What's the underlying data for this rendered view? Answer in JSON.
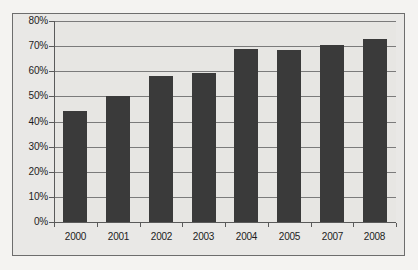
{
  "chart_data": {
    "type": "bar",
    "title": "",
    "subtitle": "",
    "xlabel": "",
    "ylabel": "",
    "categories": [
      "2000",
      "2001",
      "2002",
      "2003",
      "2004",
      "2005",
      "2007",
      "2008"
    ],
    "values": [
      44,
      50,
      58,
      59.5,
      69,
      68.5,
      70.5,
      73
    ],
    "ylim": [
      0,
      80
    ],
    "ytick_step": 10,
    "ytick_labels": [
      "0%",
      "10%",
      "20%",
      "30%",
      "40%",
      "50%",
      "60%",
      "70%",
      "80%"
    ],
    "ytick_values": [
      0,
      10,
      20,
      30,
      40,
      50,
      60,
      70,
      80
    ],
    "grid": true,
    "grid_axis": "y",
    "legend": false,
    "legend_position": "none",
    "series": [
      {
        "name": "Series 1",
        "color": "#3a3a3a",
        "values": [
          44,
          50,
          58,
          59.5,
          69,
          68.5,
          70.5,
          73
        ]
      }
    ],
    "colors": {
      "bar": "#3a3a3a",
      "plot_background": "#e7e6e3",
      "chart_background": "#e9e8e6",
      "page_background": "#f4f3f1",
      "gridline": "#7b7b7b",
      "axis": "#5a5a5a",
      "border": "#6d6d6d",
      "text": "#1d1d1d"
    }
  }
}
